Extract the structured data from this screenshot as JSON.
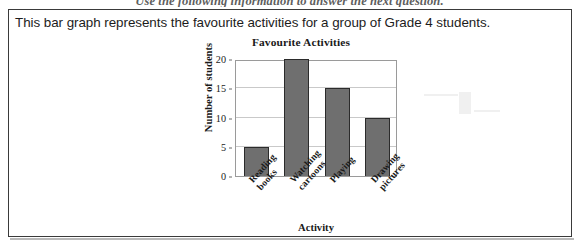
{
  "instruction": {
    "text": "Use the following information to answer the next question."
  },
  "question": {
    "stem": "This bar graph represents the favourite activities for a group of Grade 4 students."
  },
  "chart_data": {
    "type": "bar",
    "title": "Favourite Activities",
    "xlabel": "Activity",
    "ylabel": "Number of students",
    "categories": [
      "Reading\nbooks",
      "Watching\ncartoons",
      "Playing",
      "Drawing\npictures"
    ],
    "values": [
      5,
      20,
      15,
      10
    ],
    "ylim": [
      0,
      20
    ],
    "yticks": [
      0,
      5,
      10,
      15,
      20
    ],
    "ytick_labels": [
      "0",
      "5",
      "10",
      "15",
      "20"
    ],
    "grid": true,
    "grid_axis": "y",
    "legend": false,
    "bar_color": "#6f6f6f",
    "bar_edge_color": "#2b2b2b",
    "frame_color": "#9a9a9a",
    "gridline_color": "#c9c9c9"
  }
}
